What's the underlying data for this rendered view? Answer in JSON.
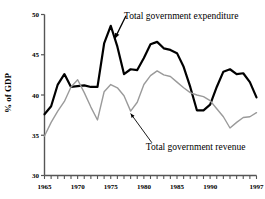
{
  "chart_data": {
    "type": "line",
    "title": "",
    "subtitle": "",
    "xlabel": "",
    "ylabel": "% of GDP",
    "xlim": [
      1965,
      1997
    ],
    "ylim": [
      30,
      50
    ],
    "grid": false,
    "legend_position": "inline-annotations",
    "xticks": [
      1965,
      1966,
      1967,
      1968,
      1969,
      1970,
      1971,
      1972,
      1973,
      1974,
      1975,
      1976,
      1977,
      1978,
      1979,
      1980,
      1981,
      1982,
      1983,
      1984,
      1985,
      1986,
      1987,
      1988,
      1989,
      1990,
      1991,
      1992,
      1993,
      1994,
      1995,
      1996,
      1997
    ],
    "xtick_labels": [
      "1965",
      "1970",
      "1975",
      "1980",
      "1985",
      "1990",
      "1997"
    ],
    "xtick_label_values": [
      1965,
      1970,
      1975,
      1980,
      1985,
      1990,
      1997
    ],
    "yticks": [
      30,
      35,
      40,
      45,
      50
    ],
    "ytick_labels": [
      "30",
      "35",
      "40",
      "45",
      "50"
    ],
    "x": [
      1965,
      1966,
      1967,
      1968,
      1969,
      1970,
      1971,
      1972,
      1973,
      1974,
      1975,
      1976,
      1977,
      1978,
      1979,
      1980,
      1981,
      1982,
      1983,
      1984,
      1985,
      1986,
      1987,
      1988,
      1989,
      1990,
      1991,
      1992,
      1993,
      1994,
      1995,
      1996,
      1997
    ],
    "series": [
      {
        "name": "Total government expenditure",
        "color": "#000000",
        "width": 2.2,
        "values": [
          37.6,
          38.6,
          41.3,
          42.6,
          41.0,
          41.1,
          41.2,
          41.0,
          41.0,
          46.4,
          48.6,
          46.0,
          42.6,
          43.2,
          43.1,
          44.6,
          46.3,
          46.6,
          45.8,
          45.6,
          45.2,
          43.5,
          41.0,
          38.1,
          38.1,
          38.8,
          41.0,
          42.9,
          43.2,
          42.6,
          42.7,
          41.6,
          39.7
        ]
      },
      {
        "name": "Total government revenue",
        "color": "#9a9a9a",
        "width": 1.4,
        "values": [
          34.9,
          36.6,
          38.0,
          39.2,
          41.0,
          41.9,
          40.3,
          38.5,
          36.9,
          40.4,
          41.3,
          40.9,
          39.9,
          38.0,
          39.1,
          41.3,
          42.4,
          43.0,
          42.5,
          42.3,
          41.6,
          40.9,
          40.3,
          40.0,
          39.8,
          39.3,
          38.3,
          37.3,
          35.9,
          36.6,
          37.2,
          37.3,
          37.8
        ]
      }
    ],
    "annotations": [
      {
        "id": "expenditure-label",
        "text": "Total government expenditure",
        "x": 1977.0,
        "y": 49.4,
        "arrow_to_x": 1975.6,
        "arrow_to_y": 47.0
      },
      {
        "id": "revenue-label",
        "text": "Total government revenue",
        "x": 1980.3,
        "y": 33.2,
        "arrow_to_x": 1978.0,
        "arrow_to_y": 37.7
      }
    ]
  },
  "colors": {
    "expenditure": "#000000",
    "revenue": "#9a9a9a",
    "axis": "#555555",
    "background": "#ffffff"
  }
}
